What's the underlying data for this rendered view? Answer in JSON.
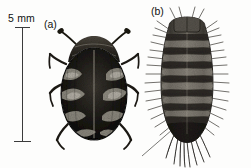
{
  "figure": {
    "background_color": "#fdfdfc",
    "ink_color": "#111111",
    "scale_bar": {
      "label": "5 mm",
      "orientation": "vertical",
      "line_color": "#3b3b3b",
      "icon": "scale-bar-icon"
    },
    "panels": [
      {
        "id": "a",
        "label": "(a)",
        "subject": "adult-carpet-beetle",
        "description": "dorsal view of dark oval beetle with mottled pale scale bands, two antennae and six legs",
        "body_color": "#1a1a1a",
        "scale_color": "#c9c6bd"
      },
      {
        "id": "b",
        "label": "(b)",
        "subject": "carpet-beetle-larva",
        "description": "dorsal view of segmented bristly larva with long caudal hair tufts",
        "body_color": "#4a4640",
        "bristle_color": "#2e2b27"
      }
    ]
  }
}
